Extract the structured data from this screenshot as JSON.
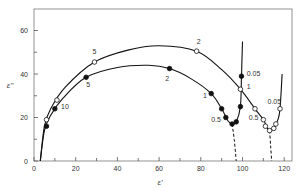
{
  "chart_data": {
    "type": "scatter",
    "title": "",
    "xlabel": "ε'",
    "ylabel": "ε''",
    "xlim": [
      0,
      122
    ],
    "ylim": [
      0,
      70
    ],
    "xticks": [
      0,
      20,
      40,
      60,
      80,
      100,
      120
    ],
    "xminor": [
      10,
      30,
      50,
      70,
      90,
      110
    ],
    "yticks": [
      0,
      20,
      40,
      60
    ],
    "yminor": [
      10,
      30,
      50
    ],
    "grid": false,
    "legend": null,
    "series": [
      {
        "name": "filled",
        "marker": "filled-circle",
        "points": [
          {
            "x": 6,
            "y": 16
          },
          {
            "x": 10,
            "y": 24
          },
          {
            "x": 25,
            "y": 38.5
          },
          {
            "x": 65,
            "y": 42.5
          },
          {
            "x": 85,
            "y": 31
          },
          {
            "x": 90,
            "y": 24
          },
          {
            "x": 92,
            "y": 20
          },
          {
            "x": 95,
            "y": 17
          },
          {
            "x": 97,
            "y": 18
          },
          {
            "x": 99,
            "y": 25
          },
          {
            "x": 99.5,
            "y": 39
          }
        ],
        "curve": [
          [
            3,
            0
          ],
          [
            5,
            14
          ],
          [
            8,
            21
          ],
          [
            14,
            29
          ],
          [
            25,
            38.5
          ],
          [
            40,
            43
          ],
          [
            55,
            44
          ],
          [
            65,
            42.5
          ],
          [
            75,
            38
          ],
          [
            85,
            31
          ],
          [
            90,
            24
          ],
          [
            93,
            18.5
          ],
          [
            95,
            17
          ],
          [
            97,
            18
          ],
          [
            99,
            25
          ],
          [
            99.5,
            39
          ],
          [
            100,
            55
          ]
        ],
        "dashed_extrapolation": [
          [
            95,
            17
          ],
          [
            96,
            10
          ],
          [
            97,
            0
          ]
        ],
        "labels": [
          {
            "text": "10",
            "x": 13,
            "y": 24
          },
          {
            "text": "5",
            "x": 25,
            "y": 34
          },
          {
            "text": "2",
            "x": 63,
            "y": 37
          },
          {
            "text": "1",
            "x": 81,
            "y": 29
          },
          {
            "text": "0.5",
            "x": 85,
            "y": 18
          },
          {
            "text": "0.05",
            "x": 102,
            "y": 39
          }
        ]
      },
      {
        "name": "open",
        "marker": "open-circle",
        "points": [
          {
            "x": 6,
            "y": 19
          },
          {
            "x": 11,
            "y": 28
          },
          {
            "x": 29,
            "y": 45.5
          },
          {
            "x": 78,
            "y": 50.5
          },
          {
            "x": 99,
            "y": 33
          },
          {
            "x": 106,
            "y": 24
          },
          {
            "x": 110,
            "y": 19
          },
          {
            "x": 111,
            "y": 16
          },
          {
            "x": 113,
            "y": 14
          },
          {
            "x": 115,
            "y": 15
          },
          {
            "x": 116,
            "y": 17
          },
          {
            "x": 118,
            "y": 24
          }
        ],
        "curve": [
          [
            3,
            0
          ],
          [
            5,
            16
          ],
          [
            8,
            24
          ],
          [
            15,
            34
          ],
          [
            29,
            45.5
          ],
          [
            45,
            51
          ],
          [
            60,
            53
          ],
          [
            78,
            50.5
          ],
          [
            90,
            42
          ],
          [
            99,
            33
          ],
          [
            106,
            24
          ],
          [
            110,
            19
          ],
          [
            112,
            15
          ],
          [
            113,
            14
          ],
          [
            115,
            15
          ],
          [
            117,
            19
          ],
          [
            118,
            24
          ],
          [
            119,
            40
          ]
        ],
        "dashed_extrapolation": [
          [
            113,
            14
          ],
          [
            113.5,
            7
          ],
          [
            114,
            0
          ]
        ],
        "labels": [
          {
            "text": "5",
            "x": 28,
            "y": 49
          },
          {
            "text": "2",
            "x": 78,
            "y": 54
          },
          {
            "text": "1",
            "x": 102,
            "y": 33
          },
          {
            "text": "0.5",
            "x": 103,
            "y": 19
          },
          {
            "text": "0.05",
            "x": 112,
            "y": 26
          }
        ]
      }
    ]
  }
}
